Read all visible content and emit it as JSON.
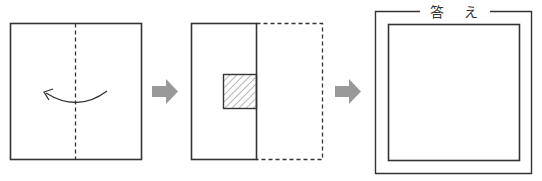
{
  "diagram": {
    "type": "paper-folding-sequence",
    "steps": [
      {
        "id": "step-1",
        "description": "Square sheet with vertical dashed center fold line and curved arrow indicating fold from right to left",
        "square": {
          "x": 10,
          "y": 23,
          "w": 131,
          "h": 136
        },
        "fold_line": {
          "x": 75,
          "style": "dashed"
        },
        "fold_arrow": {
          "direction": "right-to-left"
        }
      },
      {
        "id": "step-2",
        "description": "Folded sheet (left half solid) with original right half shown dashed; hatched square cut at the fold edge",
        "folded_rect": {
          "x": 191,
          "y": 23,
          "w": 65,
          "h": 136
        },
        "ghost_rect": {
          "x": 256,
          "y": 23,
          "w": 66,
          "h": 136,
          "style": "dashed"
        },
        "hatched_cut": {
          "x": 223,
          "y": 74,
          "w": 33,
          "h": 34
        }
      },
      {
        "id": "step-3",
        "description": "Answer frame with blank square for unfolded result",
        "outer_frame": {
          "x": 375,
          "y": 11,
          "w": 156,
          "h": 162
        },
        "inner_square": {
          "x": 388,
          "y": 24,
          "w": 131,
          "h": 136
        },
        "label": "答 え"
      }
    ],
    "arrows": [
      {
        "id": "arrow-1",
        "x": 152,
        "y": 79,
        "color": "#999999"
      },
      {
        "id": "arrow-2",
        "x": 335,
        "y": 79,
        "color": "#999999"
      }
    ],
    "colors": {
      "line": "#333333",
      "arrow": "#999999",
      "hatch": "#777777",
      "background": "#ffffff"
    }
  }
}
